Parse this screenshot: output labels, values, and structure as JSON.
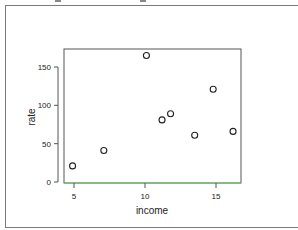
{
  "chart_data": {
    "type": "scatter",
    "title": "",
    "xlabel": "income",
    "ylabel": "rate",
    "xlim": [
      4.4,
      16.8
    ],
    "ylim": [
      -2,
      172
    ],
    "x_ticks": [
      5,
      10,
      15
    ],
    "y_ticks": [
      0,
      50,
      100,
      150
    ],
    "x_tick_labels": [
      "5",
      "10",
      "15"
    ],
    "y_tick_labels": [
      "0",
      "50",
      "100",
      "150"
    ],
    "grid": false,
    "legend": null,
    "marker": "open-circle",
    "series": [
      {
        "name": "rate vs income",
        "points": [
          {
            "x": 4.9,
            "y": 21
          },
          {
            "x": 7.1,
            "y": 41
          },
          {
            "x": 10.1,
            "y": 165
          },
          {
            "x": 11.2,
            "y": 81
          },
          {
            "x": 11.8,
            "y": 89
          },
          {
            "x": 13.5,
            "y": 61
          },
          {
            "x": 14.8,
            "y": 121
          },
          {
            "x": 16.2,
            "y": 66
          }
        ]
      }
    ]
  },
  "colors": {
    "axis": "#555555",
    "marker": "#222222",
    "ylabel": "#8b2a4a",
    "baseline": "#6cc46c",
    "frame": "#7a7a7a"
  }
}
